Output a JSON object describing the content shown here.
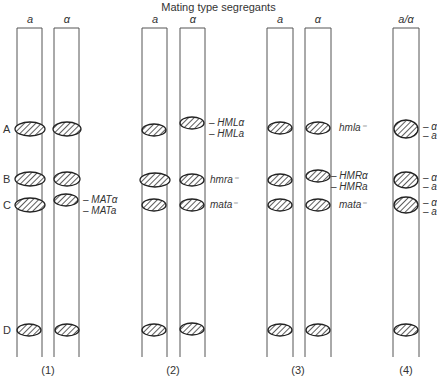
{
  "title": "Mating type segregants",
  "band_letters": [
    "A",
    "B",
    "C",
    "D"
  ],
  "panels": [
    {
      "number": "(1)",
      "columns": [
        {
          "header": "a"
        },
        {
          "header": "α"
        }
      ],
      "labels": [
        "– MATα",
        "– MATa"
      ]
    },
    {
      "number": "(2)",
      "columns": [
        {
          "header": "a"
        },
        {
          "header": "α"
        }
      ],
      "labels": [
        "– HMLα",
        "– HMLa",
        "hmra⁻",
        "mata⁻"
      ]
    },
    {
      "number": "(3)",
      "columns": [
        {
          "header": "a"
        },
        {
          "header": "α"
        }
      ],
      "labels": [
        "hmla⁻",
        "– HMRα",
        "– HMRa",
        "mata⁻"
      ]
    },
    {
      "number": "(4)",
      "columns": [
        {
          "header": "a/α"
        }
      ],
      "labels": [
        "– α",
        "– a",
        "– α",
        "– a",
        "– α",
        "– a"
      ]
    }
  ],
  "colors": {
    "line": "#555555",
    "band_fill": "#ffffff",
    "band_stroke": "#222222",
    "hatch": "#333333"
  }
}
